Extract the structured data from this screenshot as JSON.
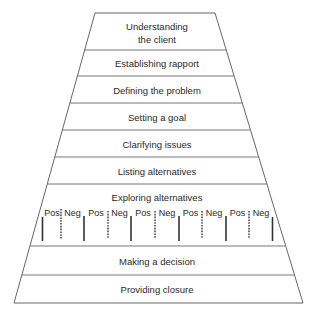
{
  "diagram": {
    "type": "funnel-stages",
    "stages": [
      {
        "label_line1": "Understanding",
        "label_line2": "the client"
      },
      {
        "label": "Establishing rapport"
      },
      {
        "label": "Defining the problem"
      },
      {
        "label": "Setting a goal"
      },
      {
        "label": "Clarifying issues"
      },
      {
        "label": "Listing alternatives"
      },
      {
        "label": "Exploring alternatives"
      },
      {
        "label": "Making a decision"
      },
      {
        "label": "Providing closure"
      }
    ],
    "pos_neg": [
      {
        "pos": "Pos",
        "neg": "Neg"
      },
      {
        "pos": "Pos",
        "neg": "Neg"
      },
      {
        "pos": "Pos",
        "neg": "Neg"
      },
      {
        "pos": "Pos",
        "neg": "Neg"
      },
      {
        "pos": "Pos",
        "neg": "Neg"
      }
    ],
    "colors": {
      "line": "#555555",
      "text": "#2a2a2a",
      "background": "#ffffff"
    }
  }
}
